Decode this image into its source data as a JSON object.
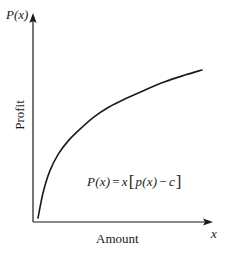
{
  "figure": {
    "background_color": "#ffffff",
    "ink_color": "#1a1a1a",
    "axis_label_y_symbol": "P(x)",
    "axis_label_x_symbol": "x",
    "axis_title_y": "Profit",
    "axis_title_x": "Amount",
    "formula": {
      "lhs": "P",
      "lhs_arg": "(x)",
      "equals": "=",
      "factor": "x",
      "bracket_open": "[",
      "inner_fn": "p",
      "inner_arg": "(x)",
      "minus": "−",
      "cost": "c",
      "bracket_close": "]",
      "full_text": "P(x) = x [p(x) − c]"
    }
  },
  "chart_data": {
    "type": "line",
    "title": "",
    "subtitle": "",
    "xlabel": "Amount",
    "ylabel": "Profit",
    "x_axis_symbol": "x",
    "y_axis_symbol": "P(x)",
    "grid": false,
    "legend": null,
    "legend_position": "none",
    "axis_arrows": true,
    "tick_labels_x": [],
    "tick_labels_y": [],
    "xlim": [
      0,
      1
    ],
    "ylim": [
      0,
      1
    ],
    "annotations": [
      {
        "text": "P(x) = x [p(x) − c]",
        "x": 0.42,
        "y": 0.22
      }
    ],
    "series": [
      {
        "name": "P(x)",
        "color": "#1a1a1a",
        "line_width": 1.6,
        "description": "Concave increasing profit curve, steep near origin then flattening",
        "x": [
          0.03,
          0.06,
          0.1,
          0.15,
          0.21,
          0.28,
          0.36,
          0.45,
          0.55,
          0.66,
          0.78,
          0.9,
          1.0
        ],
        "y": [
          0.02,
          0.17,
          0.3,
          0.4,
          0.48,
          0.55,
          0.62,
          0.68,
          0.73,
          0.78,
          0.83,
          0.87,
          0.9
        ]
      }
    ]
  }
}
